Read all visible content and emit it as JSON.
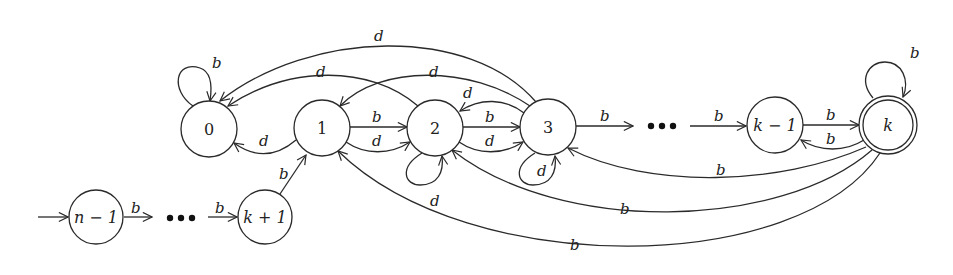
{
  "diagram": {
    "type": "finite-automaton",
    "colors": {
      "stroke": "#2a2a2a",
      "background": "#ffffff"
    },
    "states": [
      {
        "id": "0",
        "label": "0",
        "accepting": false,
        "initial": false
      },
      {
        "id": "1",
        "label": "1",
        "accepting": false,
        "initial": false
      },
      {
        "id": "2",
        "label": "2",
        "accepting": false,
        "initial": false
      },
      {
        "id": "3",
        "label": "3",
        "accepting": false,
        "initial": false
      },
      {
        "id": "k-1",
        "label": "k − 1",
        "accepting": false,
        "initial": false
      },
      {
        "id": "k",
        "label": "k",
        "accepting": true,
        "initial": false
      },
      {
        "id": "n-1",
        "label": "n − 1",
        "accepting": false,
        "initial": true
      },
      {
        "id": "k+1",
        "label": "k + 1",
        "accepting": false,
        "initial": false
      }
    ],
    "ellipses": [
      "•••",
      "•••"
    ],
    "transitions": [
      {
        "from": "0",
        "to": "0",
        "label": "b"
      },
      {
        "from": "1",
        "to": "0",
        "label": "d"
      },
      {
        "from": "2",
        "to": "0",
        "label": "d"
      },
      {
        "from": "3",
        "to": "0",
        "label": "d"
      },
      {
        "from": "3",
        "to": "1",
        "label": "d"
      },
      {
        "from": "1",
        "to": "2",
        "label": "b"
      },
      {
        "from": "1",
        "to": "2",
        "label": "d"
      },
      {
        "from": "2",
        "to": "2",
        "label": "d"
      },
      {
        "from": "2",
        "to": "3",
        "label": "b"
      },
      {
        "from": "2",
        "to": "3",
        "label": "d"
      },
      {
        "from": "3",
        "to": "2",
        "label": "d"
      },
      {
        "from": "3",
        "to": "3",
        "label": "d"
      },
      {
        "from": "3",
        "to": "...",
        "label": "b"
      },
      {
        "from": "...",
        "to": "k-1",
        "label": "b"
      },
      {
        "from": "k-1",
        "to": "k",
        "label": "b"
      },
      {
        "from": "k",
        "to": "k-1",
        "label": "b"
      },
      {
        "from": "k",
        "to": "k",
        "label": "b"
      },
      {
        "from": "k",
        "to": "3",
        "label": "b"
      },
      {
        "from": "k",
        "to": "2",
        "label": "b"
      },
      {
        "from": "k",
        "to": "1",
        "label": "b"
      },
      {
        "from": "n-1",
        "to": "...",
        "label": "b"
      },
      {
        "from": "...",
        "to": "k+1",
        "label": "b"
      },
      {
        "from": "k+1",
        "to": "1",
        "label": "b"
      }
    ]
  }
}
